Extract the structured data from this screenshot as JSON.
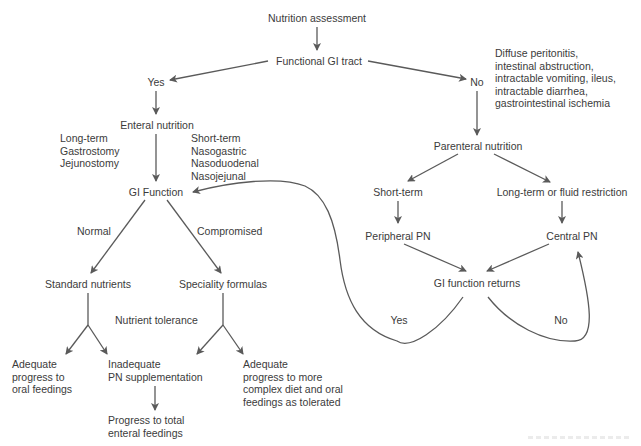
{
  "diagram": {
    "type": "flowchart",
    "title": "Nutrition assessment",
    "nodes": {
      "root": "Nutrition assessment",
      "functional_gi": "Functional GI tract",
      "yes": "Yes",
      "no": "No",
      "contraindications": [
        "Diffuse peritonitis,",
        "intestinal abstruction,",
        "intractable vomiting, ileus,",
        "intractable diarrhea,",
        "gastrointestinal ischemia"
      ],
      "enteral": "Enteral nutrition",
      "long_term": [
        "Long-term",
        "Gastrostomy",
        "Jejunostomy"
      ],
      "short_term_enteral": [
        "Short-term",
        "Nasogastric",
        "Nasoduodenal",
        "Nasojejunal"
      ],
      "gi_function": "GI Function",
      "normal": "Normal",
      "compromised": "Compromised",
      "standard": "Standard nutrients",
      "speciality": "Speciality formulas",
      "nutrient_tolerance": "Nutrient tolerance",
      "adequate_oral": [
        "Adequate",
        "progress to",
        "oral feedings"
      ],
      "inadequate": [
        "Inadequate",
        "PN supplementation"
      ],
      "progress_total": [
        "Progress to total",
        "enteral feedings"
      ],
      "adequate_complex": [
        "Adequate",
        "progress to more",
        "complex diet and oral",
        "feedings as tolerated"
      ],
      "parenteral": "Parenteral nutrition",
      "short_term_pn": "Short-term",
      "long_term_pn": "Long-term or fluid restriction",
      "peripheral": "Peripheral PN",
      "central": "Central PN",
      "gi_returns": "GI function returns",
      "returns_yes": "Yes",
      "returns_no": "No"
    },
    "edges": [
      [
        "Nutrition assessment",
        "Functional GI tract"
      ],
      [
        "Functional GI tract",
        "Yes"
      ],
      [
        "Functional GI tract",
        "No"
      ],
      [
        "Yes",
        "Enteral nutrition"
      ],
      [
        "Enteral nutrition",
        "GI Function"
      ],
      [
        "GI Function",
        "Standard nutrients",
        "Normal"
      ],
      [
        "GI Function",
        "Speciality formulas",
        "Compromised"
      ],
      [
        "Standard nutrients",
        "Adequate progress to oral feedings"
      ],
      [
        "Standard nutrients",
        "Inadequate PN supplementation"
      ],
      [
        "Speciality formulas",
        "Inadequate PN supplementation"
      ],
      [
        "Speciality formulas",
        "Adequate progress to more complex diet and oral feedings as tolerated"
      ],
      [
        "Inadequate PN supplementation",
        "Progress to total enteral feedings"
      ],
      [
        "No",
        "Parenteral nutrition"
      ],
      [
        "Parenteral nutrition",
        "Short-term"
      ],
      [
        "Parenteral nutrition",
        "Long-term or fluid restriction"
      ],
      [
        "Short-term",
        "Peripheral PN"
      ],
      [
        "Long-term or fluid restriction",
        "Central PN"
      ],
      [
        "Peripheral PN",
        "GI function returns"
      ],
      [
        "Central PN",
        "GI function returns"
      ],
      [
        "GI function returns",
        "GI Function",
        "Yes"
      ],
      [
        "GI function returns",
        "Central PN",
        "No"
      ]
    ],
    "colors": {
      "line": "#5a5a5a",
      "text": "#3b3b3b",
      "background": "#ffffff"
    }
  }
}
